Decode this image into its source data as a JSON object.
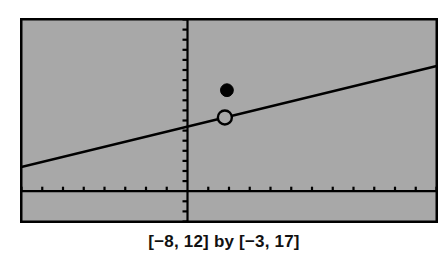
{
  "figure": {
    "kind": "graphing-calculator-screen",
    "caption": "[−8, 12] by [−3, 17]",
    "colors": {
      "screen_background": "#a8a8a8",
      "ink": "#000000",
      "page_background": "#ffffff",
      "caption_text": "#111111"
    }
  },
  "chart_data": {
    "type": "line",
    "title": "",
    "subtitle": "",
    "xlabel": "",
    "ylabel": "",
    "xlim": [
      -8,
      12
    ],
    "ylim": [
      -3,
      17
    ],
    "grid": false,
    "legend": "none",
    "axes": {
      "x_axis_at_y": 0,
      "y_axis_at_x": 0,
      "x_tick_step": 1,
      "y_tick_step": 1,
      "tick_label_visible": false
    },
    "series": [
      {
        "name": "line",
        "kind": "line",
        "slope": 0.5,
        "intercept": 6.4,
        "x_start": -8,
        "x_end": 12,
        "y_start": 2.4,
        "y_end": 12.4,
        "points": [
          {
            "x": -8,
            "y": 2.4
          },
          {
            "x": 12,
            "y": 12.4
          }
        ]
      },
      {
        "name": "open-point",
        "kind": "scatter-open",
        "points": [
          {
            "x": 1.8,
            "y": 7.3
          }
        ]
      },
      {
        "name": "filled-point",
        "kind": "scatter-filled",
        "points": [
          {
            "x": 1.9,
            "y": 10.0
          }
        ]
      }
    ],
    "annotations": [
      {
        "name": "window-caption",
        "text": "[−8, 12] by [−3, 17]",
        "position": "below-plot"
      }
    ]
  }
}
